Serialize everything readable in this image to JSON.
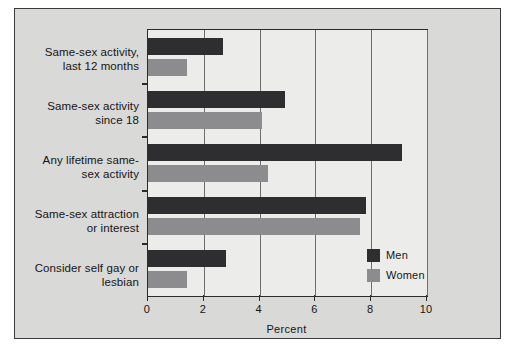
{
  "chart_data": {
    "type": "bar",
    "orientation": "horizontal",
    "title": "",
    "xlabel": "Percent",
    "ylabel": "",
    "xlim": [
      0,
      10
    ],
    "xticks": [
      0,
      2,
      4,
      6,
      8,
      10
    ],
    "grid": true,
    "legend_position": "inside-bottom-right",
    "categories": [
      "Same-sex activity, last 12 months",
      "Same-sex activity since 18",
      "Any lifetime same-sex activity",
      "Same-sex attraction or interest",
      "Consider self gay or lesbian"
    ],
    "category_lines": [
      [
        "Same-sex activity,",
        "last 12 months"
      ],
      [
        "Same-sex activity",
        "since 18"
      ],
      [
        "Any lifetime same-",
        "sex activity"
      ],
      [
        "Same-sex attraction",
        "or interest"
      ],
      [
        "Consider self gay or",
        "lesbian"
      ]
    ],
    "series": [
      {
        "name": "Men",
        "color": "#2e2e30",
        "values": [
          2.7,
          4.9,
          9.1,
          7.8,
          2.8
        ]
      },
      {
        "name": "Women",
        "color": "#8c8c8e",
        "values": [
          1.4,
          4.1,
          4.3,
          7.6,
          1.4
        ]
      }
    ]
  },
  "axis": {
    "tick_labels": [
      "0",
      "2",
      "4",
      "6",
      "8",
      "10"
    ],
    "title": "Percent"
  },
  "legend": {
    "items": [
      {
        "label": "Men",
        "swatch": "men-swatch"
      },
      {
        "label": "Women",
        "swatch": "women-swatch"
      }
    ]
  },
  "colors": {
    "men": "#2e2e30",
    "women": "#8c8c8e",
    "panel_background": "#d9d9d7",
    "plot_background": "#ececea",
    "axis": "#2b2b2b"
  }
}
